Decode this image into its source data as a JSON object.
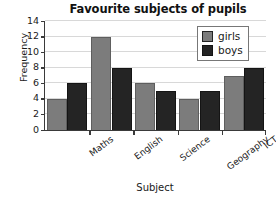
{
  "chart_data": {
    "type": "bar",
    "title": "Favourite subjects of pupils",
    "xlabel": "Subject",
    "ylabel": "Frequency",
    "categories": [
      "Maths",
      "English",
      "Science",
      "Geography",
      "ICT"
    ],
    "series": [
      {
        "name": "girls",
        "color": "#7c7c7c",
        "values": [
          4,
          12,
          6,
          4,
          7
        ]
      },
      {
        "name": "boys",
        "color": "#242424",
        "values": [
          6,
          8,
          5,
          5,
          8
        ]
      }
    ],
    "ylim": [
      0,
      14
    ],
    "yticks": [
      0,
      2,
      4,
      6,
      8,
      10,
      12,
      14
    ],
    "ytick_labels": [
      "0",
      "2",
      "4",
      "6",
      "8",
      "10",
      "12",
      "14"
    ],
    "grid": true,
    "legend_position": "top-right",
    "legend_entries": [
      "girls",
      "boys"
    ]
  }
}
